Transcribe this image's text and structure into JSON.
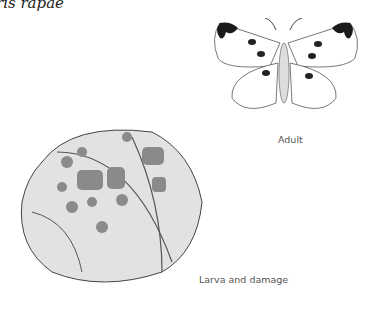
{
  "title": "ris rapae",
  "figures": {
    "adult": {
      "caption": "Adult"
    },
    "larva": {
      "caption": "Larva and damage"
    }
  },
  "colors": {
    "ink": "#333333",
    "wing_tip": "#1a1a1a",
    "leaf_fill": "#e2e2e2",
    "damage": "#8a8a8a"
  }
}
